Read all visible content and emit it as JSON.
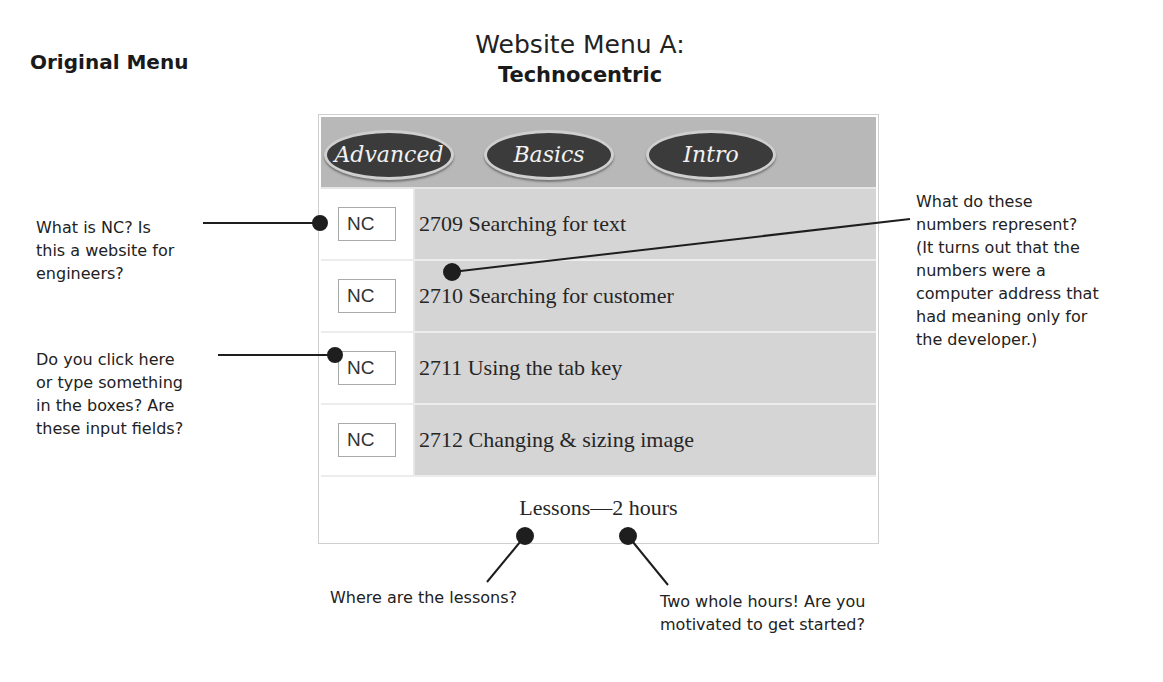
{
  "cutoff_text": "...mp... ... .p.p...",
  "labels": {
    "original_menu": "Original Menu",
    "menu_title": "Website Menu A:",
    "menu_subtitle": "Technocentric"
  },
  "menu": {
    "tabs": [
      {
        "label": "Advanced"
      },
      {
        "label": "Basics"
      },
      {
        "label": "Intro"
      }
    ],
    "rows": [
      {
        "code": "NC",
        "lesson": "2709 Searching for text"
      },
      {
        "code": "NC",
        "lesson": "2710 Searching for customer"
      },
      {
        "code": "NC",
        "lesson": "2711 Using the tab key"
      },
      {
        "code": "NC",
        "lesson": "2712 Changing & sizing image"
      }
    ],
    "footer": "Lessons—2 hours"
  },
  "annotations": {
    "nc_question": [
      "What is NC? Is",
      "this a website for",
      "engineers?"
    ],
    "input_question": [
      "Do you click here",
      "or type something",
      "in the boxes? Are",
      "these input fields?"
    ],
    "numbers_question": [
      "What do these",
      "numbers represent?",
      "(It turns out that the",
      "numbers were a",
      "computer address that",
      "had meaning only for",
      "the developer.)"
    ],
    "lessons_question": [
      "Where are the lessons?"
    ],
    "hours_question": [
      "Two whole hours! Are you",
      "motivated to get started?"
    ]
  },
  "colors": {
    "header_band": "#b8b8b8",
    "lesson_cell": "#d5d5d5",
    "oval": "#3b3b3b",
    "callout": "#1e1e1e"
  }
}
